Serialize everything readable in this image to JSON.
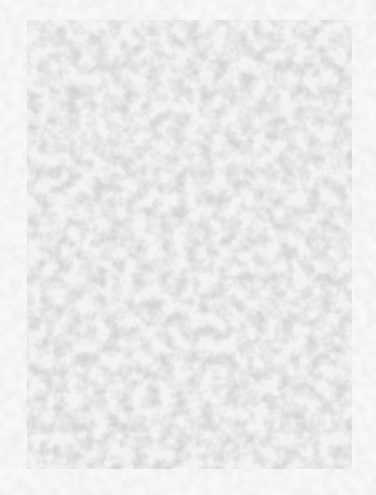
{
  "image": {
    "kind": "texture",
    "description": "mottled light gray paper texture",
    "colors": {
      "background": "#f8f8f8",
      "panel_base": "#eeeeee",
      "speckle": "#b8b8b8"
    }
  }
}
